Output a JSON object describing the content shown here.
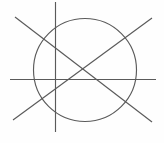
{
  "figure": {
    "width": 164,
    "height": 143,
    "background_color": "#fefefe",
    "stroke_color": "#5a5a5a",
    "stroke_width": 1.15,
    "shapes": [
      {
        "name": "circle",
        "type": "circle",
        "cx": 85,
        "cy": 70,
        "r": 51.5
      },
      {
        "name": "vertical-line",
        "type": "line",
        "x1": 55.5,
        "y1": 2,
        "x2": 55.5,
        "y2": 132
      },
      {
        "name": "horizontal-line",
        "type": "line",
        "x1": 10,
        "y1": 79.5,
        "x2": 156,
        "y2": 79.5
      },
      {
        "name": "descending-diagonal-line",
        "type": "line",
        "x1": 15,
        "y1": 17,
        "x2": 152,
        "y2": 122
      },
      {
        "name": "ascending-diagonal-line",
        "type": "line",
        "x1": 13,
        "y1": 120,
        "x2": 152,
        "y2": 18
      }
    ]
  }
}
